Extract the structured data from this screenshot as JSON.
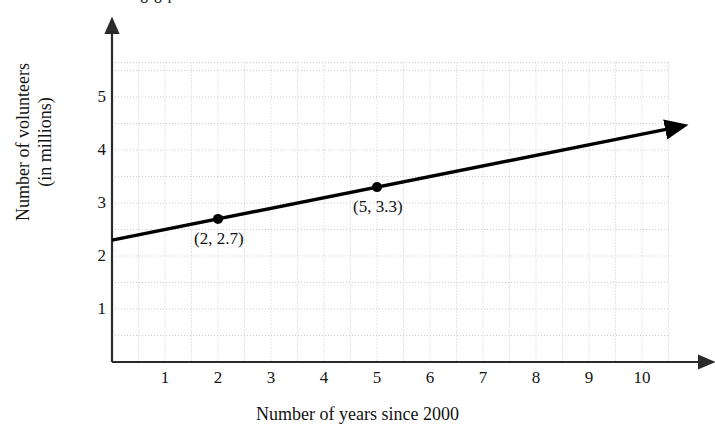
{
  "page": {
    "background_color": "#ffffff",
    "partial_top_text": "o      o        r"
  },
  "chart_data": {
    "type": "line",
    "title": "",
    "xlabel": "Number of years since 2000",
    "ylabel": "Number of volunteers (in millions)",
    "ylabel_line1": "Number of volunteers",
    "ylabel_line2": "(in millions)",
    "xlim": [
      0,
      10.5
    ],
    "ylim": [
      0,
      5.65
    ],
    "xticks": [
      1,
      2,
      3,
      4,
      5,
      6,
      7,
      8,
      9,
      10
    ],
    "xtick_labels": [
      "1",
      "2",
      "3",
      "4",
      "5",
      "6",
      "7",
      "8",
      "9",
      "10"
    ],
    "yticks": [
      1,
      2,
      3,
      4,
      5
    ],
    "ytick_labels": [
      "1",
      "2",
      "3",
      "4",
      "5"
    ],
    "grid": true,
    "grid_style": "dotted",
    "grid_step_x": 0.5,
    "grid_step_y": 0.5,
    "grid_color": "#cccccc",
    "legend": "none",
    "line_color": "#000000",
    "series": [
      {
        "name": "volunteers trend",
        "slope": 0.2,
        "intercept": 2.3,
        "x": [
          0,
          10.5
        ],
        "values": [
          2.3,
          4.4
        ],
        "arrow_end": true
      }
    ],
    "points": [
      {
        "x": 2,
        "y": 2.7,
        "label": "(2, 2.7)"
      },
      {
        "x": 5,
        "y": 3.3,
        "label": "(5, 3.3)"
      }
    ],
    "axis_arrows": {
      "x": true,
      "y": true
    }
  }
}
